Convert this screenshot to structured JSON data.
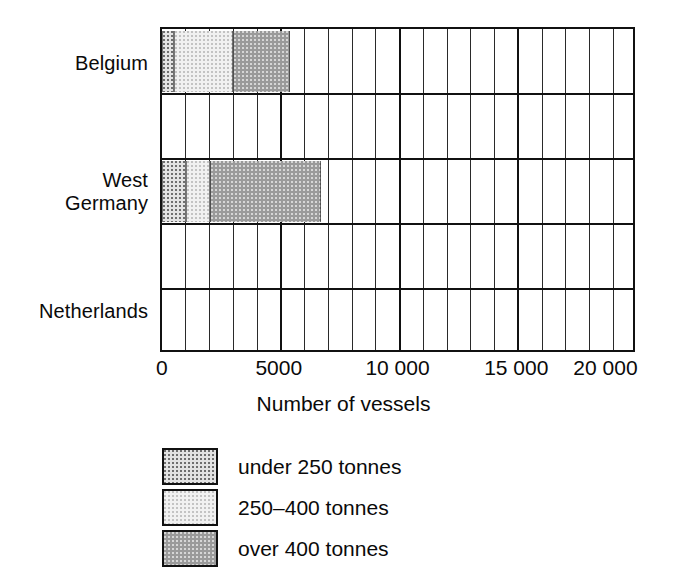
{
  "chart_data": {
    "type": "bar",
    "orientation": "horizontal",
    "stacked": true,
    "title": "",
    "xlabel": "Number of vessels",
    "ylabel": "",
    "xlim": [
      0,
      20000
    ],
    "xticks": [
      0,
      5000,
      10000,
      15000,
      20000
    ],
    "xtick_labels": [
      "0",
      "5000",
      "10 000",
      "15 000",
      "20 000"
    ],
    "grid": true,
    "minor_gridline_step": 1000,
    "major_gridline_step": 5000,
    "legend_position": "below-left",
    "categories": [
      "Belgium",
      "West Germany",
      "Netherlands"
    ],
    "series": [
      {
        "name": "under 250 tonnes",
        "values": [
          500,
          1000,
          0
        ]
      },
      {
        "name": "250–400 tonnes",
        "values": [
          2500,
          1000,
          0
        ]
      },
      {
        "name": "over 400 tonnes",
        "values": [
          2400,
          4700,
          0
        ]
      }
    ],
    "totals": [
      5400,
      6700,
      0
    ]
  },
  "axis": {
    "title": "Number of vessels",
    "ticks": [
      {
        "label": "0",
        "value": 0
      },
      {
        "label": "5000",
        "value": 5000
      },
      {
        "label": "10 000",
        "value": 10000
      },
      {
        "label": "15 000",
        "value": 15000
      },
      {
        "label": "20 000",
        "value": 20000
      }
    ]
  },
  "categories": [
    {
      "label": "Belgium"
    },
    {
      "label": "West\nGermany"
    },
    {
      "label": "Netherlands"
    }
  ],
  "legend": {
    "items": [
      {
        "label": "under 250 tonnes",
        "pattern": "dark-dots-on-light",
        "color": "#e3e3e3"
      },
      {
        "label": "250–400 tonnes",
        "pattern": "light-dots-on-pale",
        "color": "#f1f1f1"
      },
      {
        "label": "over 400 tonnes",
        "pattern": "light-dots-on-grey",
        "color": "#9a9a9a"
      }
    ]
  },
  "colors": {
    "ink": "#111111",
    "under_250": "#e3e3e3",
    "range_250_400": "#f1f1f1",
    "over_400": "#9a9a9a",
    "background": "#ffffff"
  }
}
